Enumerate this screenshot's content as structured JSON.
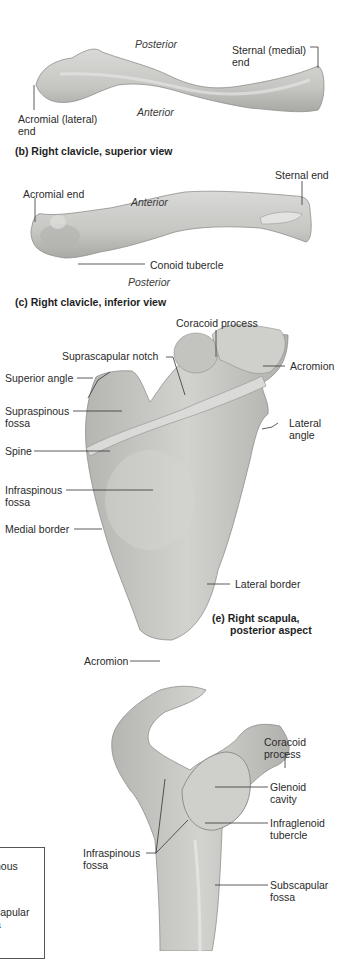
{
  "figures": [
    {
      "id": "b",
      "caption": "(b) Right clavicle, superior view",
      "labels": {
        "posterior": "Posterior",
        "anterior": "Anterior",
        "sternal_end_line1": "Sternal (medial)",
        "sternal_end_line2": "end",
        "acromial_end_line1": "Acromial (lateral)",
        "acromial_end_line2": "end"
      }
    },
    {
      "id": "c",
      "caption": "(c) Right clavicle, inferior view",
      "labels": {
        "acromial_end": "Acromial end",
        "sternal_end": "Sternal end",
        "anterior": "Anterior",
        "posterior": "Posterior",
        "conoid_tubercle": "Conoid tubercle"
      }
    },
    {
      "id": "e",
      "caption_line1": "(e) Right scapula,",
      "caption_line2": "posterior aspect",
      "labels": {
        "coracoid_process": "Coracoid process",
        "suprascapular_notch": "Suprascapular notch",
        "superior_angle": "Superior angle",
        "acromion": "Acromion",
        "supraspinous_fossa_line1": "Supraspinous",
        "supraspinous_fossa_line2": "fossa",
        "lateral_angle_line1": "Lateral",
        "lateral_angle_line2": "angle",
        "spine": "Spine",
        "infraspinous_fossa_line1": "Infraspinous",
        "infraspinous_fossa_line2": "fossa",
        "medial_border": "Medial border",
        "lateral_border": "Lateral border"
      }
    },
    {
      "id": "f",
      "labels": {
        "acromion": "Acromion",
        "coracoid_process_line1": "Coracoid",
        "coracoid_process_line2": "process",
        "glenoid_cavity_line1": "Glenoid",
        "glenoid_cavity_line2": "cavity",
        "infraglenoid_tubercle_line1": "Infraglenoid",
        "infraglenoid_tubercle_line2": "tubercle",
        "infraspinous_fossa_line1": "Infraspinous",
        "infraspinous_fossa_line2": "fossa",
        "subscapular_fossa_line1": "Subscapular",
        "subscapular_fossa_line2": "fossa"
      }
    }
  ],
  "partial_legend_box": {
    "line1": "nous",
    "line2": "capular",
    "line3": "a"
  },
  "colors": {
    "bone_fill": "#c9c9c7",
    "bone_shadow": "#a9a9a6",
    "bone_highlight": "#dcdcda",
    "leader_line": "#333333"
  }
}
